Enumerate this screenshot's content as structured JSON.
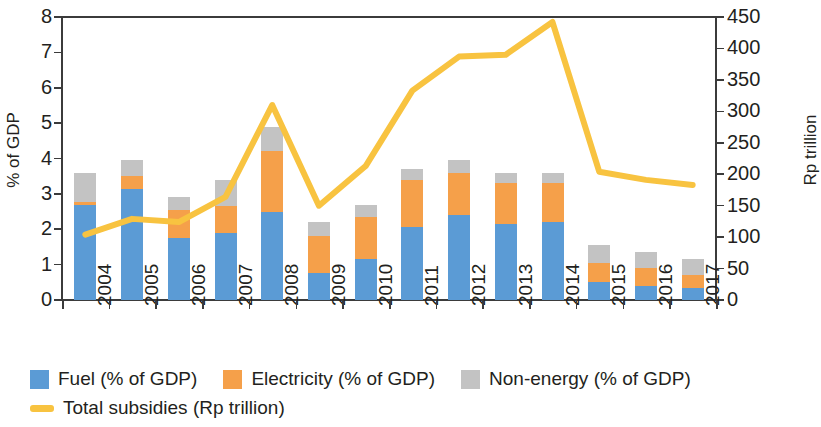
{
  "chart_data": {
    "type": "bar",
    "title": "",
    "subtitle": "",
    "xlabel": "",
    "ylabel": "% of GDP",
    "y2label": "Rp trillion",
    "grid": false,
    "legend_position": "bottom",
    "categories": [
      "2004",
      "2005",
      "2006",
      "2007",
      "2008",
      "2009",
      "2010",
      "2011",
      "2012",
      "2013",
      "2014",
      "2015",
      "2016",
      "2017"
    ],
    "ylim": [
      0,
      8
    ],
    "yticks": [
      0,
      1,
      2,
      3,
      4,
      5,
      6,
      7,
      8
    ],
    "y2lim": [
      0,
      450
    ],
    "y2ticks": [
      0,
      50,
      100,
      150,
      200,
      250,
      300,
      350,
      400,
      450
    ],
    "stacked": true,
    "series": [
      {
        "name": "Fuel (% of GDP)",
        "axis": "left",
        "kind": "bar",
        "color": "#5b9bd5",
        "values": [
          2.7,
          3.15,
          1.75,
          1.9,
          2.5,
          0.75,
          1.15,
          2.05,
          2.4,
          2.15,
          2.2,
          0.5,
          0.4,
          0.33
        ]
      },
      {
        "name": "Electricity (% of GDP)",
        "axis": "left",
        "kind": "bar",
        "color": "#f5a04a",
        "values": [
          0.08,
          0.35,
          0.8,
          0.75,
          1.7,
          1.05,
          1.2,
          1.35,
          1.2,
          1.15,
          1.1,
          0.55,
          0.5,
          0.39
        ]
      },
      {
        "name": "Non-energy (% of GDP)",
        "axis": "left",
        "kind": "bar",
        "color": "#c3c3c3",
        "values": [
          0.82,
          0.45,
          0.35,
          0.75,
          0.7,
          0.4,
          0.35,
          0.3,
          0.35,
          0.3,
          0.3,
          0.5,
          0.45,
          0.45
        ]
      },
      {
        "name": "Total subsidies (Rp trillion)",
        "axis": "right",
        "kind": "line",
        "color": "#f8c340",
        "values": [
          104,
          129,
          124,
          164,
          310,
          150,
          213,
          333,
          387,
          390,
          442,
          204,
          191,
          183
        ]
      }
    ],
    "totals_pct_of_gdp": [
      3.6,
      3.95,
      2.9,
      3.4,
      4.9,
      2.2,
      2.7,
      3.7,
      3.95,
      3.6,
      3.6,
      1.55,
      1.35,
      1.17
    ]
  },
  "legend": {
    "items": [
      {
        "label": "Fuel (% of GDP)",
        "color": "#5b9bd5",
        "marker": "square"
      },
      {
        "label": "Electricity (% of GDP)",
        "color": "#f5a04a",
        "marker": "square"
      },
      {
        "label": "Non-energy (% of GDP)",
        "color": "#c3c3c3",
        "marker": "square"
      },
      {
        "label": "Total subsidies (Rp trillion)",
        "color": "#f8c340",
        "marker": "line"
      }
    ]
  }
}
